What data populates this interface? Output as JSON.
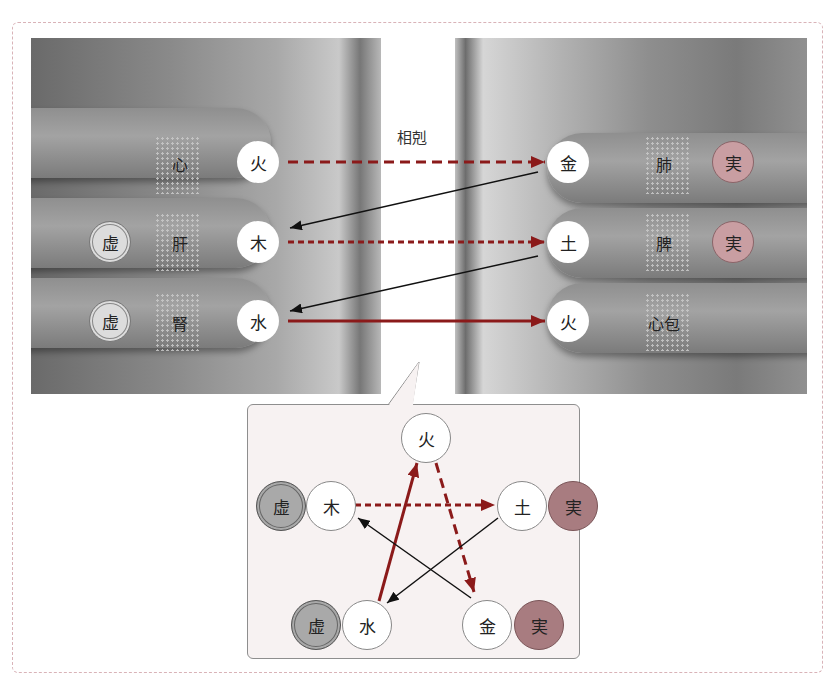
{
  "title_label": "相剋",
  "left_hand": {
    "rows": [
      {
        "organ": "心",
        "element": "火",
        "status": ""
      },
      {
        "organ": "肝",
        "element": "木",
        "status": "虚"
      },
      {
        "organ": "腎",
        "element": "水",
        "status": "虚"
      }
    ]
  },
  "right_hand": {
    "rows": [
      {
        "organ": "肺",
        "element": "金",
        "status": "実"
      },
      {
        "organ": "脾",
        "element": "土",
        "status": "実"
      },
      {
        "organ": "心包",
        "element": "火",
        "status": ""
      }
    ]
  },
  "pentagram": {
    "nodes": [
      {
        "id": "fire",
        "element": "火",
        "status": ""
      },
      {
        "id": "wood",
        "element": "木",
        "status": "虚"
      },
      {
        "id": "earth",
        "element": "土",
        "status": "実"
      },
      {
        "id": "water",
        "element": "水",
        "status": "虚"
      },
      {
        "id": "metal",
        "element": "金",
        "status": "実"
      }
    ],
    "arrows": [
      {
        "from": "火",
        "to": "金",
        "style": "dashed-red"
      },
      {
        "from": "木",
        "to": "土",
        "style": "dashed-red"
      },
      {
        "from": "水",
        "to": "火",
        "style": "solid-red"
      },
      {
        "from": "土",
        "to": "水",
        "style": "solid-black"
      },
      {
        "from": "金",
        "to": "木",
        "style": "solid-black"
      }
    ]
  },
  "colors": {
    "arrow_red": "#8b1a1a",
    "shi_fill": "#c99ea2",
    "xu_fill": "#dcdcdc",
    "popup_bg": "#f7f2f2",
    "frame_border": "#d9b3b8"
  }
}
